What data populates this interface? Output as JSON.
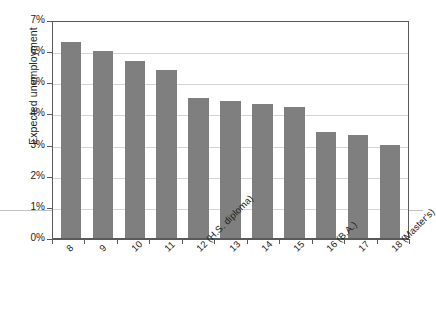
{
  "chart_data": {
    "type": "bar",
    "title": "",
    "xlabel": "",
    "ylabel": "Expected unemployment",
    "categories": [
      "8",
      "9",
      "10",
      "11",
      "12 (H.S. diploma)",
      "13",
      "14",
      "15",
      "16 (B.A.)",
      "17",
      "18 (Master's)"
    ],
    "values": [
      6.3,
      6.0,
      5.7,
      5.4,
      4.5,
      4.4,
      4.3,
      4.2,
      3.4,
      3.3,
      3.0
    ],
    "value_unit": "%",
    "ylim": [
      0,
      7
    ],
    "yticks": [
      0,
      1,
      2,
      3,
      4,
      5,
      6,
      7
    ],
    "ytick_labels": [
      "0%",
      "1%",
      "2%",
      "3%",
      "4%",
      "5%",
      "6%",
      "7%"
    ],
    "grid": true,
    "legend": "none",
    "bar_color": "#7f7f7f",
    "axis_color": "#5a5a5a",
    "grid_color": "#d4d4d4",
    "background": "#ffffff"
  }
}
